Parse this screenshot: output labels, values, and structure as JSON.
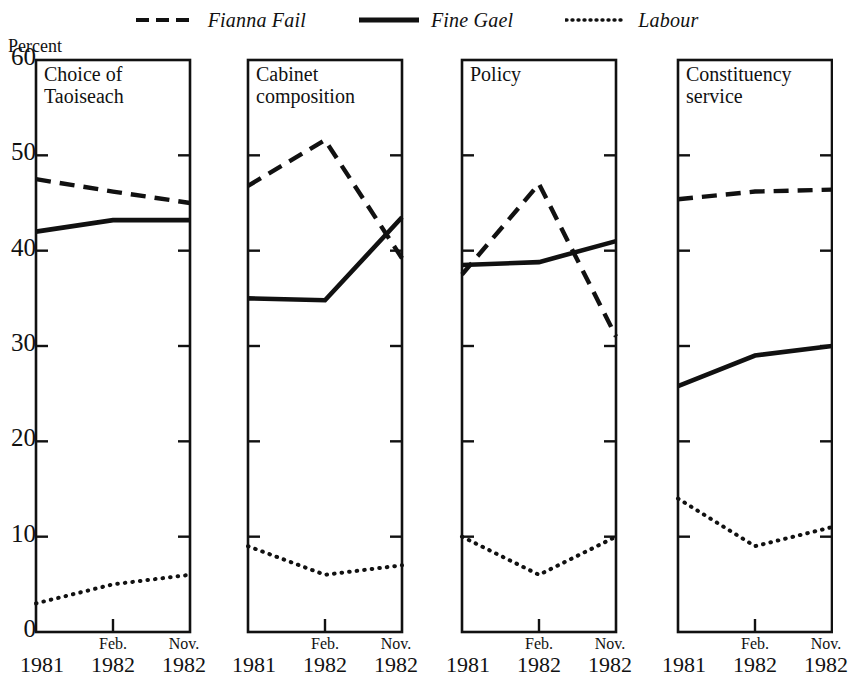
{
  "chart_data": {
    "type": "line",
    "title": "",
    "ylabel": "Percent",
    "xlabel": "",
    "ylim": [
      0,
      60
    ],
    "ytick_labels": [
      "60",
      "50",
      "40",
      "30",
      "20",
      "10",
      "0"
    ],
    "ytick_values": [
      60,
      50,
      40,
      30,
      20,
      10,
      0
    ],
    "grid": false,
    "legend_position": "top-center",
    "categories": [
      "1981",
      "Feb. 1982",
      "Nov. 1982"
    ],
    "xtick_labels": [
      {
        "top": "",
        "bottom": "1981"
      },
      {
        "top": "Feb.",
        "bottom": "1982"
      },
      {
        "top": "Nov.",
        "bottom": "1982"
      }
    ],
    "legend": [
      {
        "name": "Fianna Fail",
        "style": "dashed"
      },
      {
        "name": "Fine Gael",
        "style": "solid"
      },
      {
        "name": "Labour",
        "style": "dotted"
      }
    ],
    "panels": [
      {
        "title": "Choice of\nTaoiseach",
        "series": [
          {
            "name": "Fianna Fail",
            "style": "dashed",
            "values": [
              47.5,
              46.2,
              45.0
            ]
          },
          {
            "name": "Fine Gael",
            "style": "solid",
            "values": [
              42.0,
              43.2,
              43.2
            ]
          },
          {
            "name": "Labour",
            "style": "dotted",
            "values": [
              3.0,
              5.0,
              6.0
            ]
          }
        ]
      },
      {
        "title": "Cabinet\ncomposition",
        "series": [
          {
            "name": "Fianna Fail",
            "style": "dashed",
            "values": [
              46.8,
              51.6,
              39.2
            ]
          },
          {
            "name": "Fine Gael",
            "style": "solid",
            "values": [
              35.0,
              34.8,
              43.5
            ]
          },
          {
            "name": "Labour",
            "style": "dotted",
            "values": [
              9.0,
              6.0,
              7.0
            ]
          }
        ]
      },
      {
        "title": "Policy",
        "series": [
          {
            "name": "Fianna Fail",
            "style": "dashed",
            "values": [
              37.5,
              47.0,
              31.0
            ]
          },
          {
            "name": "Fine Gael",
            "style": "solid",
            "values": [
              38.5,
              38.8,
              41.0
            ]
          },
          {
            "name": "Labour",
            "style": "dotted",
            "values": [
              10.0,
              6.0,
              10.0
            ]
          }
        ]
      },
      {
        "title": "Constituency\nservice",
        "series": [
          {
            "name": "Fianna Fail",
            "style": "dashed",
            "values": [
              45.4,
              46.2,
              46.4
            ]
          },
          {
            "name": "Fine Gael",
            "style": "solid",
            "values": [
              25.8,
              29.0,
              30.0
            ]
          },
          {
            "name": "Labour",
            "style": "dotted",
            "values": [
              14.0,
              9.0,
              11.0
            ]
          }
        ]
      }
    ],
    "colors": {
      "line": "#111111",
      "axis": "#111111",
      "background": "#ffffff"
    }
  }
}
